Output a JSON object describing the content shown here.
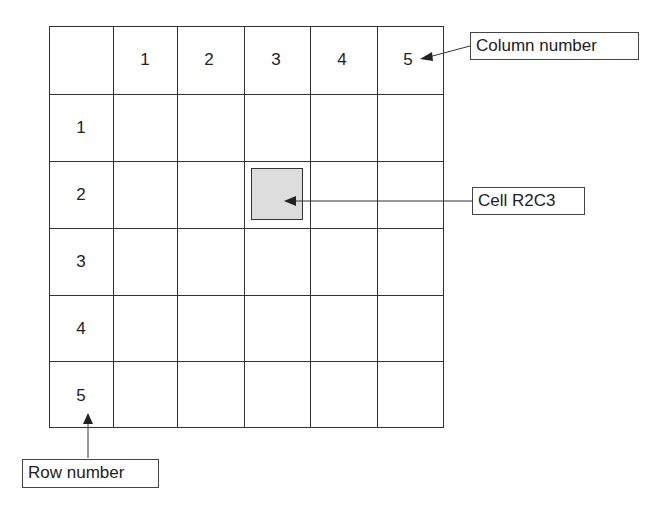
{
  "diagram": {
    "column_headers": [
      "1",
      "2",
      "3",
      "4",
      "5"
    ],
    "row_headers": [
      "1",
      "2",
      "3",
      "4",
      "5"
    ],
    "highlighted_cell": {
      "row": 2,
      "col": 3,
      "fill": "#dddddd"
    },
    "callouts": {
      "column": "Column number",
      "cell": "Cell R2C3",
      "row": "Row number"
    }
  }
}
